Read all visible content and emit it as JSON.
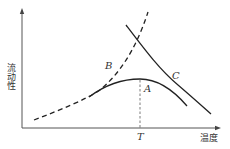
{
  "diagram": {
    "y_axis_label": "流动性",
    "x_axis_label": "温度",
    "curves": [
      {
        "label": "A",
        "style": "solid",
        "shape": "arch peaking at T"
      },
      {
        "label": "B",
        "style": "dashed",
        "shape": "increasing"
      },
      {
        "label": "C",
        "style": "solid",
        "shape": "decreasing"
      }
    ],
    "marker": {
      "label": "T",
      "style": "dashed vertical line at peak of A"
    },
    "colors": {
      "line": "#222222",
      "axis": "#555555",
      "background": "#ffffff"
    }
  }
}
